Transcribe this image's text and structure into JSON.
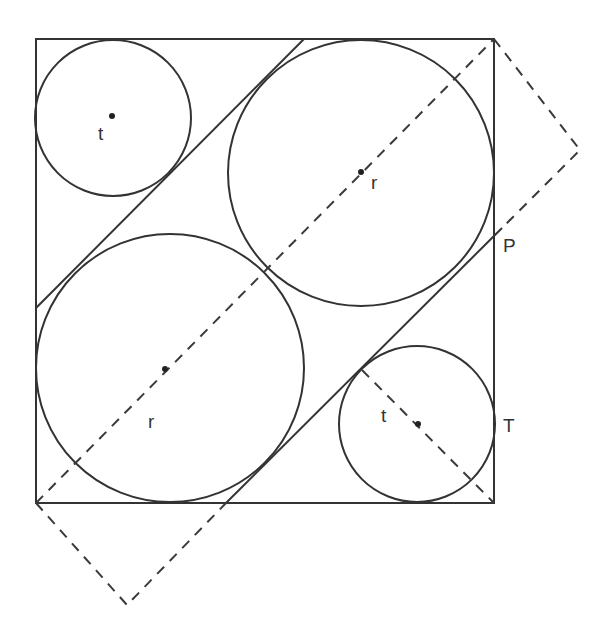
{
  "diagram": {
    "square": {
      "x1": 36,
      "y1": 39,
      "x2": 494,
      "y2": 503
    },
    "circles": [
      {
        "id": "small-top-left",
        "cx": 112,
        "cy": 118,
        "r": 78,
        "label": "t"
      },
      {
        "id": "large-top-right",
        "cx": 361,
        "cy": 173,
        "r": 133,
        "label": "r"
      },
      {
        "id": "large-bottom-left",
        "cx": 169,
        "cy": 369,
        "r": 134,
        "label": "r"
      },
      {
        "id": "small-bottom-right",
        "cx": 417,
        "cy": 424,
        "r": 78,
        "label": "t"
      }
    ],
    "labels": {
      "t_top": "t",
      "r_top": "r",
      "r_bottom": "r",
      "t_bottom": "t",
      "P": "P",
      "T": "T"
    }
  }
}
